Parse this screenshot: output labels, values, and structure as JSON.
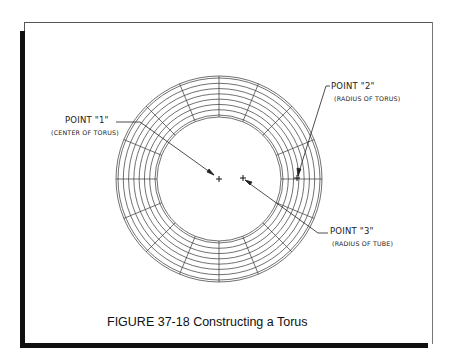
{
  "figure": {
    "caption": "FIGURE 37-18  Constructing a Torus"
  },
  "labels": {
    "point1": {
      "title": "POINT \"1\"",
      "subtitle": "(CENTER OF TORUS)"
    },
    "point2": {
      "title": "POINT \"2\"",
      "subtitle": "(RADIUS OF TORUS)"
    },
    "point3": {
      "title": "POINT \"3\"",
      "subtitle": "(RADIUS OF TUBE)"
    }
  },
  "geometry": {
    "center": [
      219,
      179
    ],
    "outer_radius": 103,
    "inner_radius": 62,
    "ring_count": 7,
    "meridian_count": 16,
    "line_color": "#333333"
  }
}
